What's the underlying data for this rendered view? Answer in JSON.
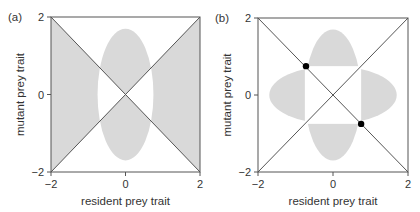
{
  "chart_data": [
    {
      "type": "area",
      "panel_label": "(a)",
      "title": "",
      "xlabel": "resident prey trait",
      "ylabel": "mutant prey trait",
      "xlim": [
        -2,
        2
      ],
      "ylim": [
        -2,
        2
      ],
      "xticks": [
        "-2",
        "0",
        "2"
      ],
      "yticks": [
        "-2",
        "0",
        "2"
      ],
      "grid": false,
      "lines": [
        {
          "name": "diagonal y=x",
          "x": [
            -2,
            2
          ],
          "y": [
            -2,
            2
          ]
        },
        {
          "name": "anti-diagonal y=-x",
          "x": [
            -2,
            2
          ],
          "y": [
            2,
            -2
          ]
        }
      ],
      "shaded_regions": {
        "description": "Gray where mutant invades: side triangles (|x|>|y|) outside ellipse, top/bottom triangles (|y|>|x|) inside ellipse",
        "ellipse": {
          "cx": 0,
          "cy": 0,
          "rx": 0.75,
          "ry": 1.7
        }
      },
      "points": []
    },
    {
      "type": "area",
      "panel_label": "(b)",
      "title": "",
      "xlabel": "resident prey trait",
      "ylabel": "mutant prey trait",
      "xlim": [
        -2,
        2
      ],
      "ylim": [
        -2,
        2
      ],
      "xticks": [
        "-2",
        "0",
        "2"
      ],
      "yticks": [
        "-2",
        "0",
        "2"
      ],
      "grid": false,
      "lines": [
        {
          "name": "diagonal y=x",
          "x": [
            -2,
            2
          ],
          "y": [
            -2,
            2
          ]
        },
        {
          "name": "anti-diagonal y=-x",
          "x": [
            -2,
            2
          ],
          "y": [
            2,
            -2
          ]
        }
      ],
      "shaded_regions": {
        "description": "Four lobes outside central square |x|,|y|<0.75; top/bottom lobes inside ellipse rx=0.75 ry=1.7, left/right lobes inside ellipse rx=1.7 ry=0.75",
        "inner_square_half": 0.75,
        "vertical_ellipse": {
          "cx": 0,
          "cy": 0,
          "rx": 0.75,
          "ry": 1.7
        },
        "horizontal_ellipse": {
          "cx": 0,
          "cy": 0,
          "rx": 1.7,
          "ry": 0.75
        }
      },
      "points": [
        {
          "x": -0.72,
          "y": 0.75
        },
        {
          "x": 0.75,
          "y": -0.75
        }
      ]
    }
  ],
  "colors": {
    "shade": "#d9d9d9",
    "line": "#555555",
    "frame": "#555555",
    "point": "#000000"
  },
  "panels": [
    {
      "frame": {
        "x0": 51,
        "y0": 17,
        "x1": 200,
        "y1": 172
      }
    },
    {
      "frame": {
        "x0": 258,
        "y0": 18,
        "x1": 408,
        "y1": 172
      }
    }
  ]
}
